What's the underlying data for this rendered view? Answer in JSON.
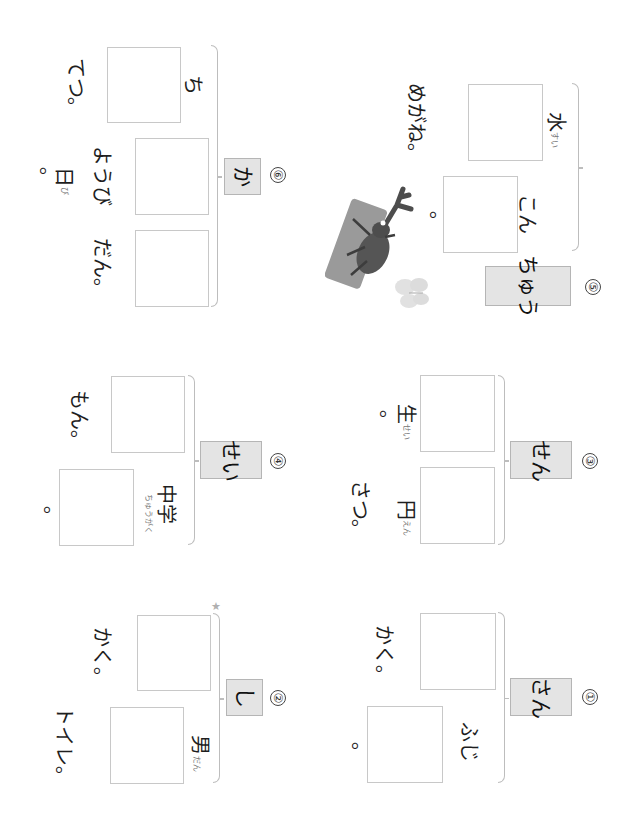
{
  "worksheet": {
    "orientation": "rotated 90deg clockwise",
    "problems": [
      {
        "number": "①",
        "reading": "さん",
        "sentences": [
          {
            "before": "",
            "after": "かく。"
          },
          {
            "before": "ふじ",
            "after": "。"
          }
        ]
      },
      {
        "number": "②",
        "reading": "し",
        "sentences": [
          {
            "before": "",
            "after": "かく。"
          },
          {
            "before": "男",
            "before_ruby": "だん",
            "after": "トイレ。"
          }
        ]
      },
      {
        "number": "③",
        "reading": "せん",
        "sentences": [
          {
            "before": "",
            "after": "生",
            "after_ruby": "せい",
            "tail": "。"
          },
          {
            "before": "",
            "after": "円",
            "after_ruby": "えん",
            "tail": "さつ。"
          }
        ]
      },
      {
        "number": "④",
        "reading": "せい",
        "sentences": [
          {
            "before": "",
            "after": "もん。"
          },
          {
            "before": "中学",
            "before_ruby": "ちゅうがく",
            "after": "。"
          }
        ]
      },
      {
        "number": "⑤",
        "reading": "ちゅう",
        "sentences": [
          {
            "before": "水",
            "before_ruby": "すい",
            "after": "めがね。"
          },
          {
            "before": "こん",
            "after": "。"
          }
        ]
      },
      {
        "number": "⑥",
        "reading": "か",
        "sentences": [
          {
            "before": "ち",
            "after": "てつ。"
          },
          {
            "before": "",
            "after": "ようび",
            "after_kanji": "日",
            "after_ruby": "び",
            "tail": "。"
          },
          {
            "before": "",
            "after": "だん。"
          }
        ]
      }
    ],
    "decorations": {
      "star": "★",
      "illustration": "rhinoceros beetle on a log with a butterfly"
    }
  }
}
